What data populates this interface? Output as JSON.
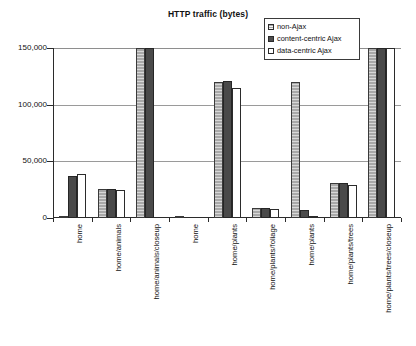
{
  "chart_data": {
    "type": "bar",
    "title": "HTTP traffic (bytes)",
    "xlabel": "",
    "ylabel": "",
    "ylim": [
      0,
      150000
    ],
    "yticks": [
      0,
      50000,
      100000,
      150000
    ],
    "ytick_labels": [
      "0",
      "50,000",
      "100,000",
      "150,000"
    ],
    "grid": true,
    "legend_position": "top-right",
    "categories": [
      "home",
      "home/animals",
      "home/animals/closeup",
      "home",
      "home/plants",
      "home/plants/foliage",
      "home/plants",
      "home/plants/trees",
      "home/plants/trees/closeup"
    ],
    "series": [
      {
        "name": "non-Ajax",
        "color": "#a9a9a9",
        "values": [
          1500,
          26000,
          150000,
          700,
          120000,
          8500,
          120000,
          31000,
          150000
        ]
      },
      {
        "name": "content-centric Ajax",
        "color": "#4a4a4a",
        "values": [
          37000,
          26000,
          150000,
          0,
          121000,
          9000,
          7000,
          31000,
          150000
        ]
      },
      {
        "name": "data-centric Ajax",
        "color": "#ffffff",
        "values": [
          38500,
          25000,
          0,
          0,
          115000,
          8000,
          2000,
          29000,
          150000
        ]
      }
    ]
  },
  "legend": {
    "items": [
      {
        "label": "non-Ajax"
      },
      {
        "label": "content-centric Ajax"
      },
      {
        "label": "data-centric Ajax"
      }
    ]
  }
}
